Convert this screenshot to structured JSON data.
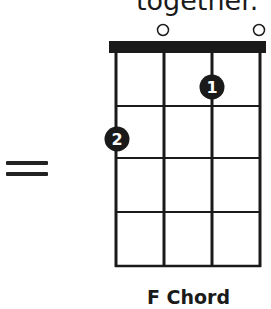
{
  "header": {
    "text_cropped": "together."
  },
  "operator": {
    "symbol": "equals"
  },
  "chord": {
    "name": "F Chord",
    "strings": 4,
    "frets_shown": 4,
    "open_strings": [
      2,
      4
    ],
    "fingers": [
      {
        "label": "1",
        "string": 3,
        "fret": 1
      },
      {
        "label": "2",
        "string": 1,
        "fret": 2
      }
    ],
    "colors": {
      "ink": "#1a1a1a",
      "dot_text": "#ffffff",
      "background": "#ffffff"
    }
  }
}
